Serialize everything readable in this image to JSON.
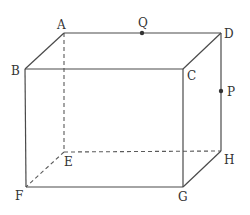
{
  "figure": {
    "type": "rectangular-prism",
    "vertices": [
      "A",
      "B",
      "C",
      "D",
      "E",
      "F",
      "G",
      "H"
    ],
    "points": [
      "P",
      "Q"
    ],
    "labels": {
      "A": "A",
      "B": "B",
      "C": "C",
      "D": "D",
      "E": "E",
      "F": "F",
      "G": "G",
      "H": "H",
      "P": "P",
      "Q": "Q"
    },
    "visible_edges": [
      [
        "A",
        "D"
      ],
      [
        "A",
        "B"
      ],
      [
        "B",
        "C"
      ],
      [
        "C",
        "D"
      ],
      [
        "B",
        "F"
      ],
      [
        "F",
        "G"
      ],
      [
        "C",
        "G"
      ],
      [
        "D",
        "H"
      ],
      [
        "G",
        "H"
      ]
    ],
    "hidden_edges": [
      [
        "A",
        "E"
      ],
      [
        "E",
        "F"
      ],
      [
        "E",
        "H"
      ]
    ],
    "point_on_edge": {
      "Q": [
        "A",
        "D"
      ],
      "P": [
        "D",
        "H"
      ]
    },
    "colors": {
      "line": "#4a4a4a",
      "text": "#333333"
    }
  }
}
